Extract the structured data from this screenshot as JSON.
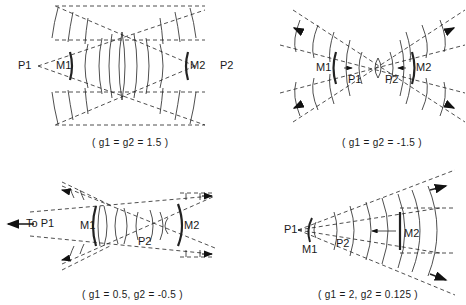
{
  "figure": {
    "panels": [
      {
        "id": "a",
        "caption": "( g1 = g2 = 1.5 )",
        "g1": "1.5",
        "g2": "1.5",
        "labels": {
          "p1": "P1",
          "p2": "P2",
          "m1": "M1",
          "m2": "M2"
        }
      },
      {
        "id": "b",
        "caption": "( g1 = g2 = -1.5 )",
        "g1": "-1.5",
        "g2": "-1.5",
        "labels": {
          "p1": "P1",
          "p2": "P2",
          "m1": "M1",
          "m2": "M2"
        }
      },
      {
        "id": "c",
        "caption": "( g1 = 0.5, g2 = -0.5 )",
        "g1": "0.5",
        "g2": "-0.5",
        "labels": {
          "to_p1": "To P1",
          "p2": "P2",
          "m1": "M1",
          "m2": "M2"
        }
      },
      {
        "id": "d",
        "caption": "( g1 = 2, g2 = 0.125 )",
        "g1": "2",
        "g2": "0.125",
        "labels": {
          "p1": "P1",
          "p2": "P2",
          "m1": "M1",
          "m2": "M2"
        }
      }
    ]
  }
}
